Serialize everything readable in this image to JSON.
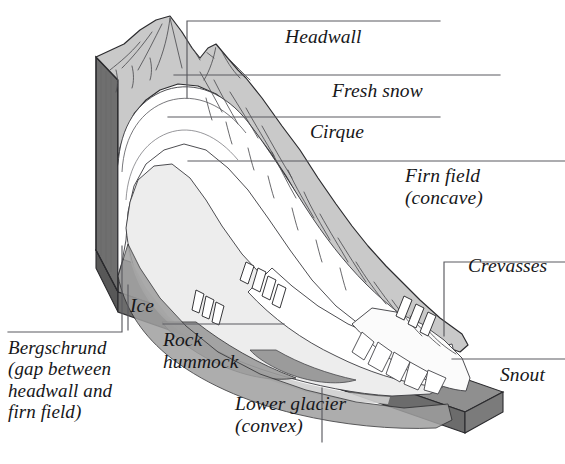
{
  "figure": {
    "kind": "labeled-cross-section-diagram",
    "background_color": "#ffffff",
    "palette": {
      "ink": "#17171a",
      "leader_line": "#5a5a60",
      "rock_side_dark": "#6c6c6c",
      "rock_side_darker": "#5e5e5e",
      "mountain_light": "#c9c9c9",
      "mountain_mid": "#bdbdbd",
      "snow_white": "#ffffff",
      "ice_shadow": "#d8d8d8",
      "valley_band": "#9a9a9a",
      "outline": "#2b2b2e"
    }
  },
  "labels": [
    {
      "id": "headwall",
      "text": "Headwall",
      "lines": [
        "Headwall"
      ]
    },
    {
      "id": "fresh_snow",
      "text": "Fresh snow",
      "lines": [
        "Fresh snow"
      ]
    },
    {
      "id": "cirque",
      "text": "Cirque",
      "lines": [
        "Cirque"
      ]
    },
    {
      "id": "firn_field",
      "text": "Firn field (concave)",
      "lines": [
        "Firn field",
        "(concave)"
      ]
    },
    {
      "id": "crevasses",
      "text": "Crevasses",
      "lines": [
        "Crevasses"
      ]
    },
    {
      "id": "ice",
      "text": "Ice",
      "lines": [
        "Ice"
      ]
    },
    {
      "id": "bergschrund",
      "text": "Bergschrund (gap between headwall and firn field)",
      "lines": [
        "Bergschrund",
        "(gap between",
        "headwall and",
        "firn field)"
      ]
    },
    {
      "id": "rock_hummock",
      "text": "Rock hummock",
      "lines": [
        "Rock",
        "hummock"
      ]
    },
    {
      "id": "snout",
      "text": "Snout",
      "lines": [
        "Snout"
      ]
    },
    {
      "id": "lower_glacier",
      "text": "Lower glacier (convex)",
      "lines": [
        "Lower glacier",
        "(convex)"
      ]
    }
  ],
  "label_text": {
    "headwall": "Headwall",
    "fresh_snow": "Fresh snow",
    "cirque": "Cirque",
    "firn_field_l1": "Firn field",
    "firn_field_l2": "(concave)",
    "crevasses": "Crevasses",
    "ice": "Ice",
    "bergschrund_l1": "Bergschrund",
    "bergschrund_l2": "(gap between",
    "bergschrund_l3": "headwall and",
    "bergschrund_l4": "firn field)",
    "rock_hummock_l1": "Rock",
    "rock_hummock_l2": "hummock",
    "snout": "Snout",
    "lower_glacier_l1": "Lower glacier",
    "lower_glacier_l2": "(convex)"
  }
}
